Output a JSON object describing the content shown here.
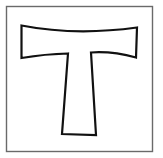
{
  "image": {
    "subject": "tau-cross",
    "description": "Tau cross symbol outlined in black inside a square frame",
    "colors": {
      "background": "#ffffff",
      "frame_stroke": "#6a6a6a",
      "cross_stroke": "#111111",
      "cross_fill": "#ffffff"
    }
  }
}
